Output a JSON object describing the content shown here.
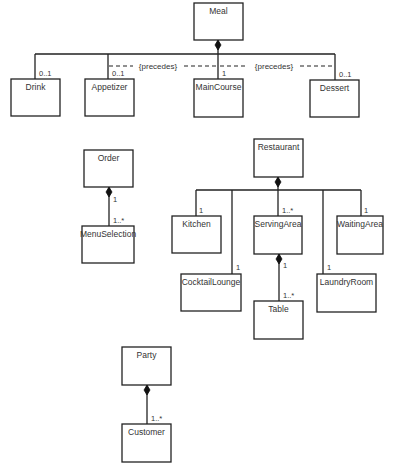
{
  "classes": {
    "meal": "Meal",
    "drink": "Drink",
    "appetizer": "Appetizer",
    "main_course": "MainCourse",
    "dessert": "Dessert",
    "order": "Order",
    "menu_selection": "MenuSelection",
    "restaurant": "Restaurant",
    "kitchen": "Kitchen",
    "serving_area": "ServingArea",
    "waiting_area": "WaitingArea",
    "cocktail_lounge": "CocktailLounge",
    "laundry_room": "LaundryRoom",
    "table": "Table",
    "party": "Party",
    "customer": "Customer"
  },
  "multiplicities": {
    "meal_drink": "0..1",
    "meal_appetizer": "0..1",
    "meal_main_course": "1",
    "meal_dessert": "0..1",
    "order_end": "1",
    "order_menu_selection": "1..*",
    "restaurant_kitchen": "1",
    "restaurant_serving_area": "1..*",
    "restaurant_waiting_area": "1",
    "restaurant_cocktail_lounge": "1",
    "restaurant_laundry_room": "1",
    "serving_area_end": "1",
    "serving_area_table": "1..*",
    "party_customer": "1..*"
  },
  "constraints": {
    "appetizer_main": "{precedes}",
    "main_dessert": "{precedes}"
  },
  "colors": {
    "line": "#222222",
    "text": "#333333",
    "background": "#ffffff"
  }
}
